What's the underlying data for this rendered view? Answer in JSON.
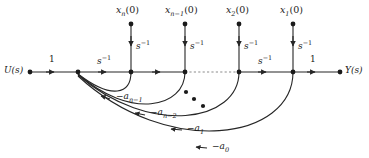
{
  "figure": {
    "type": "signal-flow-graph",
    "colors": {
      "line": "#262626",
      "text": "#1a1a1a",
      "dotted": "#8c8c8c",
      "background": "#ffffff"
    }
  },
  "terminals": {
    "input_label": "U(s)",
    "output_label": "Y(s)"
  },
  "forward_gains": {
    "input_gain": "1",
    "output_gain": "1",
    "integrator_1": "s⁻¹",
    "integrator_2": "s⁻¹"
  },
  "initial_conditions": [
    {
      "label": "x",
      "sub": "n",
      "suffix": "(0)",
      "gain_base": "s",
      "gain_exp": "−1"
    },
    {
      "label": "x",
      "sub": "n−1",
      "suffix": "(0)",
      "gain_base": "s",
      "gain_exp": "−1"
    },
    {
      "label": "x",
      "sub": "2",
      "suffix": "(0)",
      "gain_base": "s",
      "gain_exp": "−1"
    },
    {
      "label": "x",
      "sub": "1",
      "suffix": "(0)",
      "gain_base": "s",
      "gain_exp": "−1"
    }
  ],
  "feedback_gains": [
    {
      "label": "−a",
      "sub": "n−1"
    },
    {
      "label": "−a",
      "sub": "n−2"
    },
    {
      "label": "−a",
      "sub": "1"
    },
    {
      "label": "−a",
      "sub": "0"
    }
  ],
  "integrator_labels": {
    "left_base": "s",
    "left_exp": "−1",
    "right_base": "s",
    "right_exp": "−1"
  },
  "ellipsis": {
    "symbol": "•",
    "count": 3
  }
}
